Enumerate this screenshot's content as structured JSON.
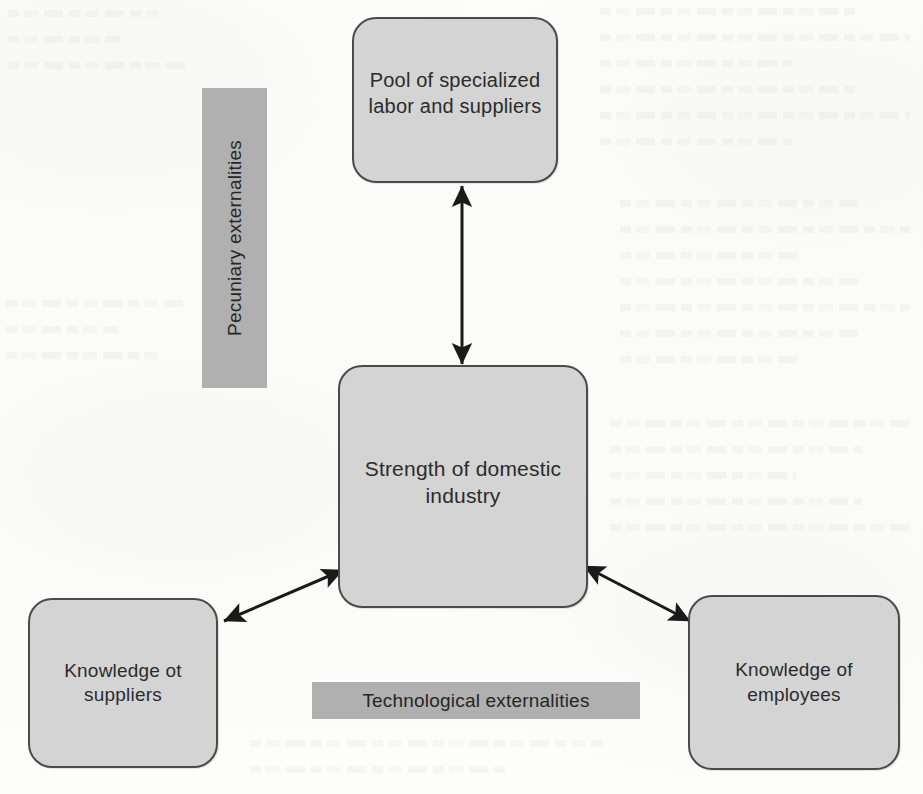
{
  "diagram": {
    "type": "concept-diagram",
    "background_note": "scanned book page, faint bleed-through ghost text",
    "nodes": [
      {
        "id": "top",
        "label": "Pool of specialized\nlabor and suppliers",
        "position": "top-center"
      },
      {
        "id": "center",
        "label": "Strength of domestic\nindustry",
        "position": "center"
      },
      {
        "id": "bottom-left",
        "label": "Knowledge ot\nsuppliers",
        "position": "bottom-left"
      },
      {
        "id": "bottom-right",
        "label": "Knowledge of\nemployees",
        "position": "bottom-right"
      }
    ],
    "bands": [
      {
        "id": "pecuniary",
        "label": "Pecuniary externalities",
        "orientation": "vertical",
        "rotation_deg": -90
      },
      {
        "id": "technological",
        "label": "Technological externalities",
        "orientation": "horizontal",
        "rotation_deg": 0
      }
    ],
    "connectors": [
      {
        "id": "top-center",
        "from": "center",
        "to": "top",
        "style": "double-headed-arrow",
        "direction": "vertical"
      },
      {
        "id": "center-bottom-left",
        "from": "center",
        "to": "bottom-left",
        "style": "double-headed-arrow",
        "direction": "diagonal"
      },
      {
        "id": "center-bottom-right",
        "from": "center",
        "to": "bottom-right",
        "style": "double-headed-arrow",
        "direction": "diagonal"
      }
    ],
    "colors": {
      "node_fill": "#d4d4d4",
      "node_border": "#4a4a4a",
      "band_fill": "#b0b0b0",
      "text": "#2b2b2b",
      "arrow": "#1a1a1a",
      "page_background": "#fdfdfc"
    }
  }
}
